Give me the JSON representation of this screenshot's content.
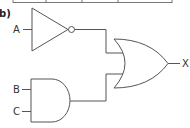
{
  "diagram": {
    "part_label": "b)",
    "type": "logic-circuit",
    "inputs": [
      "A",
      "B",
      "C"
    ],
    "output": "X",
    "gates": [
      {
        "type": "NOT",
        "inputs": [
          "A"
        ]
      },
      {
        "type": "AND",
        "inputs": [
          "B",
          "C"
        ]
      },
      {
        "type": "OR",
        "inputs": [
          "NOT A",
          "B AND C"
        ],
        "output": "X"
      }
    ],
    "expression": "X = NOT A OR (B AND C)"
  },
  "labels": {
    "part": "b)",
    "input_a": "A",
    "input_b": "B",
    "input_c": "C",
    "output_x": "X"
  }
}
